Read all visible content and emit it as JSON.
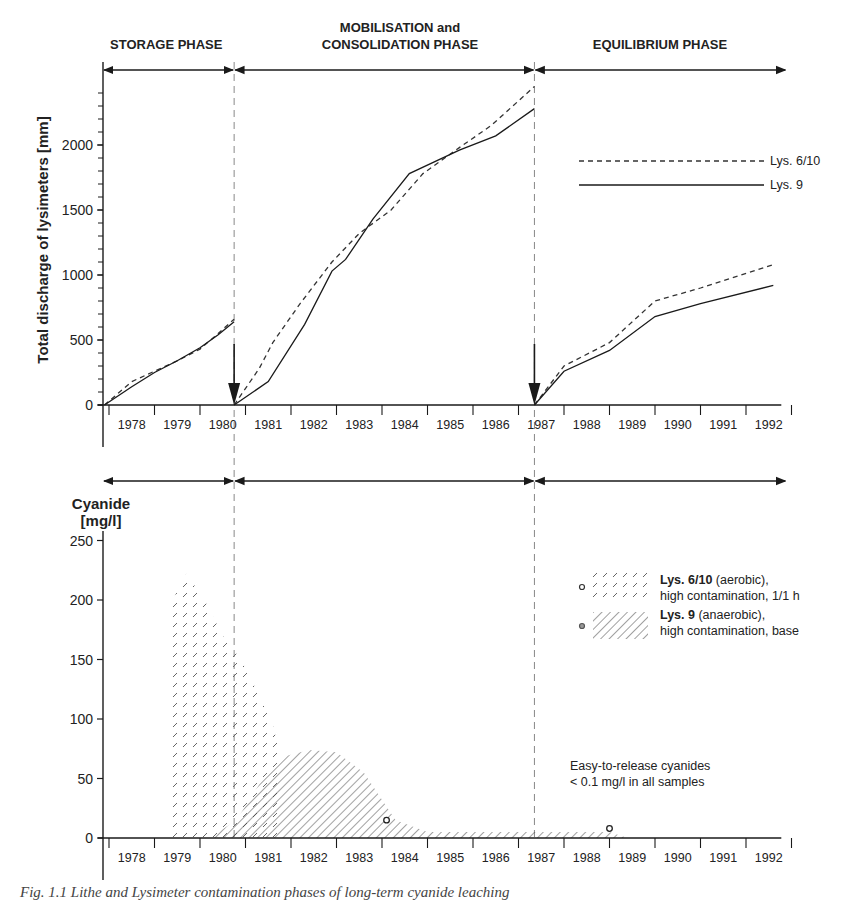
{
  "phases": [
    {
      "label": "STORAGE PHASE",
      "start_year": 1977.8,
      "end_year": 1980.75
    },
    {
      "label_line1": "MOBILISATION and",
      "label_line2": "CONSOLIDATION PHASE",
      "start_year": 1980.75,
      "end_year": 1987.35
    },
    {
      "label": "EQUILIBRIUM PHASE",
      "start_year": 1987.35,
      "end_year": 1992.6
    }
  ],
  "years": [
    "1978",
    "1979",
    "1980",
    "1981",
    "1982",
    "1983",
    "1984",
    "1985",
    "1986",
    "1987",
    "1988",
    "1989",
    "1990",
    "1991",
    "1992"
  ],
  "colors": {
    "line": "#1a1a1a",
    "dashed": "#333333",
    "hatch": "#555555",
    "divider": "#888888"
  },
  "caption": "Fig. 1.1 Lithe and Lysimeter contamination phases of long-term cyanide leaching",
  "chart_data": [
    {
      "type": "line",
      "title": "",
      "ylabel": "Total discharge of lysimeters [mm]",
      "xlabel": "",
      "ylim": [
        0,
        2500
      ],
      "yticks": [
        0,
        500,
        1000,
        1500,
        2000
      ],
      "grid": false,
      "legend_position": "upper right",
      "x_categories": [
        "1978",
        "1979",
        "1980",
        "1981",
        "1982",
        "1983",
        "1984",
        "1985",
        "1986",
        "1987",
        "1988",
        "1989",
        "1990",
        "1991",
        "1992"
      ],
      "annotations": [
        "Reset arrow at start of 1981",
        "Reset arrow at mid 1987"
      ],
      "series": [
        {
          "name": "Lys. 6/10",
          "style": "dashed",
          "segments": [
            {
              "x": [
                1977.9,
                1978.5,
                1979.0,
                1979.5,
                1980.0,
                1980.4,
                1980.75
              ],
              "y": [
                0,
                180,
                260,
                340,
                430,
                550,
                660
              ]
            },
            {
              "x": [
                1980.75,
                1981.3,
                1981.6,
                1982.2,
                1982.9,
                1983.5,
                1984.2,
                1984.9,
                1985.7,
                1986.4,
                1987.35
              ],
              "y": [
                0,
                280,
                480,
                780,
                1100,
                1320,
                1500,
                1780,
                1980,
                2150,
                2450
              ]
            },
            {
              "x": [
                1987.35,
                1988.0,
                1989.0,
                1990.0,
                1991.0,
                1992.6
              ],
              "y": [
                0,
                300,
                480,
                800,
                900,
                1080
              ]
            }
          ]
        },
        {
          "name": "Lys. 9",
          "style": "solid",
          "segments": [
            {
              "x": [
                1977.9,
                1978.5,
                1979.0,
                1979.5,
                1980.0,
                1980.4,
                1980.75
              ],
              "y": [
                0,
                140,
                250,
                340,
                440,
                540,
                640
              ]
            },
            {
              "x": [
                1980.75,
                1981.5,
                1982.3,
                1982.9,
                1983.2,
                1983.8,
                1984.6,
                1985.7,
                1986.5,
                1987.35
              ],
              "y": [
                0,
                180,
                620,
                1030,
                1120,
                1430,
                1780,
                1960,
                2070,
                2280
              ]
            },
            {
              "x": [
                1987.35,
                1988.0,
                1989.0,
                1990.0,
                1991.0,
                1992.6
              ],
              "y": [
                0,
                260,
                420,
                680,
                780,
                920
              ]
            }
          ]
        }
      ]
    },
    {
      "type": "area",
      "title": "",
      "ylabel": "Cyanide [mg/l]",
      "xlabel": "",
      "ylim": [
        0,
        250
      ],
      "yticks": [
        0,
        50,
        100,
        150,
        200,
        250
      ],
      "grid": false,
      "legend_position": "right",
      "x_categories": [
        "1978",
        "1979",
        "1980",
        "1981",
        "1982",
        "1983",
        "1984",
        "1985",
        "1986",
        "1987",
        "1988",
        "1989",
        "1990",
        "1991",
        "1992"
      ],
      "series": [
        {
          "name": "Lys. 6/10 (aerobic), high contamination, 1/1 h",
          "legend_bold": "Lys. 6/10",
          "legend_rest": " (aerobic),",
          "legend_line2": "high contamination, 1/1 h",
          "pattern": "short-dash-hatch",
          "x": [
            1979.3,
            1979.4,
            1979.7,
            1980.1,
            1980.5,
            1980.9,
            1981.3,
            1981.6,
            1981.7,
            1981.75
          ],
          "y": [
            0,
            200,
            222,
            200,
            170,
            150,
            120,
            95,
            80,
            0
          ]
        },
        {
          "name": "Lys. 9 (anaerobic), high contamination, base",
          "legend_bold": "Lys. 9",
          "legend_rest": " (anaerobic),",
          "legend_line2": "high contamination, base",
          "pattern": "diagonal-hatch",
          "x": [
            1980.2,
            1980.8,
            1981.3,
            1981.8,
            1982.4,
            1983.0,
            1983.6,
            1984.3,
            1985.0,
            1986.0,
            1987.0,
            1988.0,
            1989.0,
            1989.4
          ],
          "y": [
            0,
            15,
            45,
            68,
            74,
            72,
            55,
            15,
            5,
            5,
            5,
            5,
            5,
            0
          ]
        }
      ],
      "markers": [
        {
          "series": "Lys. 6/10",
          "x": 1984.1,
          "y": 15
        },
        {
          "series": "Lys. 9",
          "x": 1989.0,
          "y": 8
        }
      ],
      "annotations": [
        {
          "line1": "Easy-to-release cyanides",
          "line2": "< 0.1 mg/l in all samples"
        }
      ]
    }
  ]
}
